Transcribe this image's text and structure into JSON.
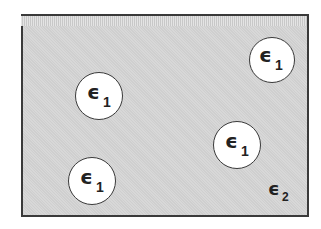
{
  "diagram": {
    "medium": {
      "label": "ϵ",
      "subscript": "2",
      "fill": "#cfcfcf",
      "border": "#3a3a3a"
    },
    "inclusions": [
      {
        "label": "ϵ",
        "subscript": "1",
        "cx": 99,
        "cy": 96,
        "r": 24
      },
      {
        "label": "ϵ",
        "subscript": "1",
        "cx": 272,
        "cy": 60,
        "r": 23
      },
      {
        "label": "ϵ",
        "subscript": "1",
        "cx": 237,
        "cy": 145,
        "r": 24
      },
      {
        "label": "ϵ",
        "subscript": "1",
        "cx": 92,
        "cy": 181,
        "r": 24
      }
    ]
  }
}
